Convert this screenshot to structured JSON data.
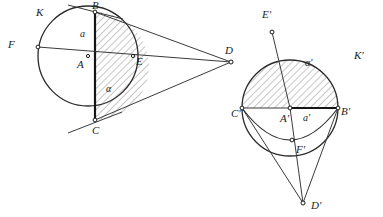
{
  "figure": {
    "width": 383,
    "height": 217,
    "background_color": "#ffffff",
    "ink_color": "#2b2b2b",
    "hatch_color": "#5a5a5a"
  },
  "left_figure": {
    "name": "circle-k-construction",
    "circle": {
      "label": "K",
      "center_label": "A",
      "cx": 88,
      "cy": 56,
      "r": 50
    },
    "points": [
      {
        "id": "B",
        "label": "B",
        "x": 95,
        "y": 12,
        "label_x": 92,
        "label_y": 9,
        "marker": true
      },
      {
        "id": "C",
        "label": "C",
        "x": 95,
        "y": 120,
        "label_x": 92,
        "label_y": 134,
        "marker": true
      },
      {
        "id": "A",
        "label": "A",
        "x": 88,
        "y": 56,
        "label_x": 77,
        "label_y": 68,
        "marker": true
      },
      {
        "id": "F",
        "label": "F",
        "x": 38,
        "y": 47,
        "label_x": 8,
        "label_y": 48,
        "marker": true
      },
      {
        "id": "E",
        "label": "E",
        "x": 133,
        "y": 56,
        "label_x": 136,
        "label_y": 65,
        "marker": true
      },
      {
        "id": "D",
        "label": "D",
        "x": 231,
        "y": 62,
        "label_x": 225,
        "label_y": 54,
        "marker": true
      }
    ],
    "segment_labels": [
      {
        "id": "a",
        "label": "a",
        "x": 80,
        "y": 37
      },
      {
        "id": "alpha",
        "label": "α",
        "x": 106,
        "y": 92
      }
    ],
    "circle_label": {
      "label": "K",
      "x": 36,
      "y": 16
    },
    "shaded_region_note": "circular segment between chord BC and the right-hand arc B-E-C"
  },
  "right_figure": {
    "name": "circle-k-prime-construction",
    "circle": {
      "label": "K'",
      "center_label": "A'",
      "cx": 290,
      "cy": 108,
      "r": 48
    },
    "points": [
      {
        "id": "Ep",
        "label": "E'",
        "x": 272,
        "y": 32,
        "label_x": 262,
        "label_y": 18,
        "marker": true
      },
      {
        "id": "Cp",
        "label": "C'",
        "x": 242,
        "y": 108,
        "label_x": 234,
        "label_y": 117,
        "marker": true
      },
      {
        "id": "Ap",
        "label": "A'",
        "x": 290,
        "y": 108,
        "label_x": 282,
        "label_y": 122,
        "marker": true
      },
      {
        "id": "Bp",
        "label": "B'",
        "x": 338,
        "y": 108,
        "label_x": 341,
        "label_y": 115,
        "marker": true
      },
      {
        "id": "Fp",
        "label": "F'",
        "x": 292,
        "y": 140,
        "label_x": 297,
        "label_y": 153,
        "marker": true
      },
      {
        "id": "Dp",
        "label": "D'",
        "x": 303,
        "y": 203,
        "label_x": 311,
        "label_y": 209,
        "marker": true
      }
    ],
    "segment_labels": [
      {
        "id": "aprime",
        "label": "a'",
        "x": 305,
        "y": 120
      },
      {
        "id": "alphaprime",
        "label": "α'",
        "x": 307,
        "y": 66
      }
    ],
    "circle_label": {
      "label": "K'",
      "x": 354,
      "y": 59
    },
    "shaded_region_note": "region above chord C'B' bounded by the upper arc of circle K'"
  }
}
